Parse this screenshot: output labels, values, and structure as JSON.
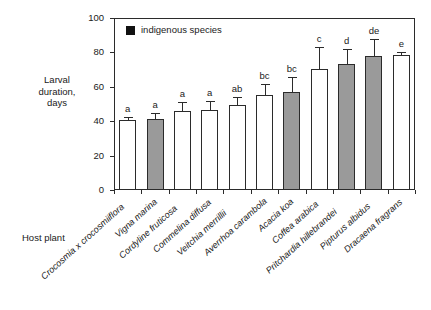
{
  "chart_data": {
    "type": "bar",
    "title": "",
    "xlabel": "Host plant",
    "ylabel": "Larval duration, days",
    "ylabel_lines": [
      "Larval",
      "duration,",
      "days"
    ],
    "ylim": [
      0,
      100
    ],
    "yticks": [
      0,
      20,
      40,
      60,
      80,
      100
    ],
    "ytick_labels": [
      "0",
      "20",
      "40",
      "60",
      "80",
      "100"
    ],
    "grid": false,
    "legend": {
      "position": "top-left-inside",
      "entries": [
        {
          "label": "indigenous species",
          "marker": "filled-square",
          "color": "#111111"
        }
      ]
    },
    "colors": {
      "introduced_bar_fill": "#ffffff",
      "indigenous_bar_fill": "#9a9a9a",
      "outline": "#2b2b2b",
      "legend_swatch": "#111111"
    },
    "categories": [
      "Crocosmia x crocosmiiflora",
      "Vigna marina",
      "Cordyline fruticosa",
      "Commelina diffusa",
      "Veitchia merrillii",
      "Averrhoa carambola",
      "Acacia koa",
      "Coffea arabica",
      "Pritchardia hillebrandei",
      "Pipturus albidus",
      "Dracaena fragrans"
    ],
    "values": [
      40.5,
      41.5,
      46.0,
      46.5,
      49.5,
      55.0,
      57.0,
      70.5,
      73.5,
      78.0,
      78.5
    ],
    "errors": [
      2.0,
      3.0,
      5.0,
      5.5,
      4.5,
      6.5,
      8.5,
      12.5,
      8.5,
      10.0,
      2.0
    ],
    "indigenous": [
      false,
      true,
      false,
      false,
      false,
      false,
      true,
      false,
      true,
      true,
      false
    ],
    "significance_letters": [
      "a",
      "a",
      "a",
      "a",
      "ab",
      "bc",
      "bc",
      "c",
      "d",
      "de",
      "e"
    ],
    "series": [
      {
        "name": "Larval duration",
        "values": [
          40.5,
          41.5,
          46.0,
          46.5,
          49.5,
          55.0,
          57.0,
          70.5,
          73.5,
          78.0,
          78.5
        ]
      }
    ]
  }
}
